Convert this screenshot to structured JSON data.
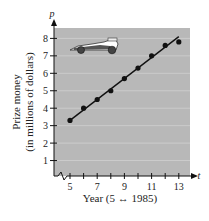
{
  "chart_data": {
    "type": "scatter",
    "title": "",
    "xlabel": "Year (5 ↔ 1985)",
    "ylabel_line1": "Prize money",
    "ylabel_line2": "(in millions of dollars)",
    "x_axis_letter": "t",
    "y_axis_letter": "p",
    "xlim": [
      4,
      13.5
    ],
    "ylim": [
      0,
      8.5
    ],
    "x_ticks": [
      5,
      6,
      7,
      8,
      9,
      10,
      11,
      12,
      13
    ],
    "x_tick_labels": [
      "5",
      "7",
      "9",
      "11",
      "13"
    ],
    "x_tick_label_values": [
      5,
      7,
      9,
      11,
      13
    ],
    "y_ticks": [
      1,
      2,
      3,
      4,
      5,
      6,
      7,
      8
    ],
    "y_tick_labels": [
      "1",
      "2",
      "3",
      "4",
      "5",
      "6",
      "7",
      "8"
    ],
    "grid": true,
    "axis_break": "x-axis near origin",
    "series": [
      {
        "name": "Prize money",
        "type": "scatter",
        "x": [
          5,
          6,
          7,
          8,
          9,
          10,
          11,
          12,
          13
        ],
        "y": [
          3.3,
          4.0,
          4.5,
          5.0,
          5.7,
          6.3,
          7.0,
          7.6,
          7.8
        ]
      },
      {
        "name": "Linear model",
        "type": "line",
        "x": [
          5,
          13
        ],
        "y": [
          3.3,
          8.1
        ]
      }
    ],
    "annotation": "race-car illustration",
    "colors": {
      "plot_background": "#b8b8b8",
      "gridline": "#d0d0d0",
      "marks": "#111111"
    }
  }
}
